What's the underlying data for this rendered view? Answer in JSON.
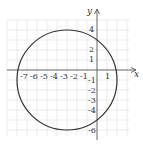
{
  "header": {
    "cropped_text": "..."
  },
  "graph": {
    "x_axis_label": "x",
    "y_axis_label": "y",
    "x_tick_labels": [
      "-7",
      "-6",
      "-5",
      "-4",
      "-3",
      "-2",
      "-1",
      "1"
    ],
    "y_tick_labels_positive": [
      "4",
      "2",
      "1"
    ],
    "y_tick_labels_negative": [
      "-1",
      "-2",
      "-3",
      "-4",
      "-6"
    ],
    "circle": {
      "center": [
        -3,
        -1
      ],
      "radius": 5
    },
    "colors": {
      "grid": "#dcdcdc",
      "axis": "#555555",
      "curve": "#333333"
    }
  }
}
